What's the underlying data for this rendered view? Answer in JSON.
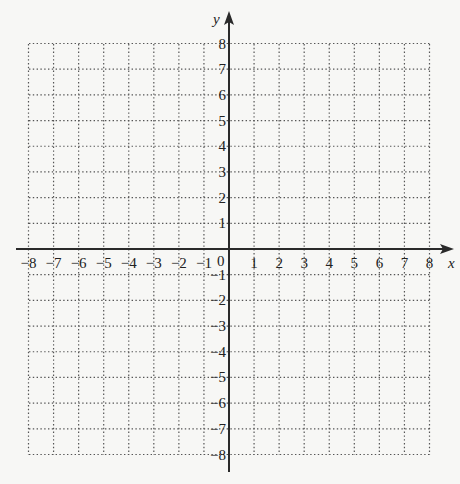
{
  "chart_data": {
    "type": "scatter",
    "title": "",
    "xlabel": "x",
    "ylabel": "y",
    "xlim": [
      -8,
      8
    ],
    "ylim": [
      -8,
      8
    ],
    "grid": true,
    "grid_style": "dotted",
    "x": [],
    "y": [],
    "series": [],
    "x_ticks": [
      -8,
      -7,
      -6,
      -5,
      -4,
      -3,
      -2,
      -1,
      1,
      2,
      3,
      4,
      5,
      6,
      7,
      8
    ],
    "y_ticks": [
      8,
      7,
      6,
      5,
      4,
      3,
      2,
      1,
      -1,
      -2,
      -3,
      -4,
      -5,
      -6,
      -7,
      -8
    ],
    "origin_label": "0",
    "legend": null
  },
  "axes": {
    "x_label": "x",
    "y_label": "y",
    "origin_label": "0",
    "x_tick_labels": [
      "−8",
      "−7",
      "−6",
      "−5",
      "−4",
      "−3",
      "−2",
      "−1",
      "1",
      "2",
      "3",
      "4",
      "5",
      "6",
      "7",
      "8"
    ],
    "x_tick_values": [
      -8,
      -7,
      -6,
      -5,
      -4,
      -3,
      -2,
      -1,
      1,
      2,
      3,
      4,
      5,
      6,
      7,
      8
    ],
    "y_tick_labels": [
      "8",
      "7",
      "6",
      "5",
      "4",
      "3",
      "2",
      "1",
      "−1",
      "−2",
      "−3",
      "−4",
      "−5",
      "−6",
      "−7",
      "−8"
    ],
    "y_tick_values": [
      8,
      7,
      6,
      5,
      4,
      3,
      2,
      1,
      -1,
      -2,
      -3,
      -4,
      -5,
      -6,
      -7,
      -8
    ]
  },
  "colors": {
    "background": "#f7f7f5",
    "axis": "#2a2a2a",
    "grid": "#555555",
    "text": "#222222"
  }
}
